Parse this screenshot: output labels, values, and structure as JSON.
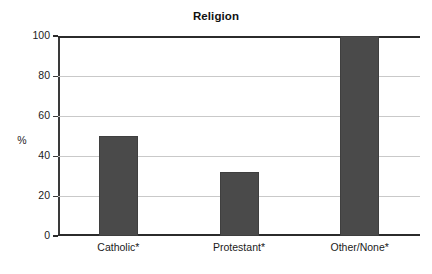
{
  "chart_data": {
    "type": "bar",
    "title": "Religion",
    "xlabel": "",
    "ylabel": "%",
    "categories": [
      "Catholic*",
      "Protestant*",
      "Other/None*"
    ],
    "values": [
      50,
      32,
      100
    ],
    "ylim": [
      0,
      100
    ],
    "yticks": [
      0,
      20,
      40,
      60,
      80,
      100
    ],
    "ytick_labels": [
      "0",
      "20",
      "40",
      "60",
      "80",
      "100"
    ],
    "grid": true,
    "grid_axis": "y",
    "legend": false,
    "bar_color": "#4a4a4a",
    "gridline_color": "#c9c9c9",
    "axis_color": "#2b2b2b",
    "background_color": "#ffffff",
    "annotations": [
      "* category label marked with asterisk"
    ]
  },
  "figure": {
    "title": "Religion",
    "y_axis_title": "%"
  }
}
